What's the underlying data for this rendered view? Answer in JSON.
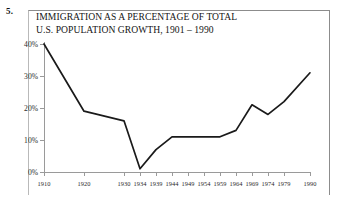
{
  "question_number": "5.",
  "chart_data": {
    "type": "line",
    "title": "IMMIGRATION AS A PERCENTAGE OF TOTAL\nU.S. POPULATION GROWTH, 1901 – 1990",
    "title_line1": "IMMIGRATION AS A PERCENTAGE OF TOTAL",
    "title_line2": "U.S. POPULATION GROWTH, 1901 – 1990",
    "xlabel": "",
    "ylabel": "",
    "grid": false,
    "legend": false,
    "ylim": [
      0,
      40
    ],
    "ytick_labels": [
      "0%",
      "10%",
      "20%",
      "30%",
      "40%"
    ],
    "ytick_values": [
      0,
      10,
      20,
      30,
      40
    ],
    "categories": [
      "1910",
      "1920",
      "1930",
      "1934",
      "1939",
      "1944",
      "1949",
      "1954",
      "1959",
      "1964",
      "1969",
      "1974",
      "1979",
      "1990"
    ],
    "values": [
      40,
      19,
      16,
      1,
      7,
      11,
      11,
      11,
      11,
      13,
      21,
      18,
      22,
      31
    ],
    "series": [
      {
        "name": "Immigration share of U.S. population growth",
        "values": [
          40,
          19,
          16,
          1,
          7,
          11,
          11,
          11,
          11,
          13,
          21,
          18,
          22,
          31
        ]
      }
    ],
    "line_color": "#1a1a1a",
    "axis_color": "#9a9a9a"
  }
}
